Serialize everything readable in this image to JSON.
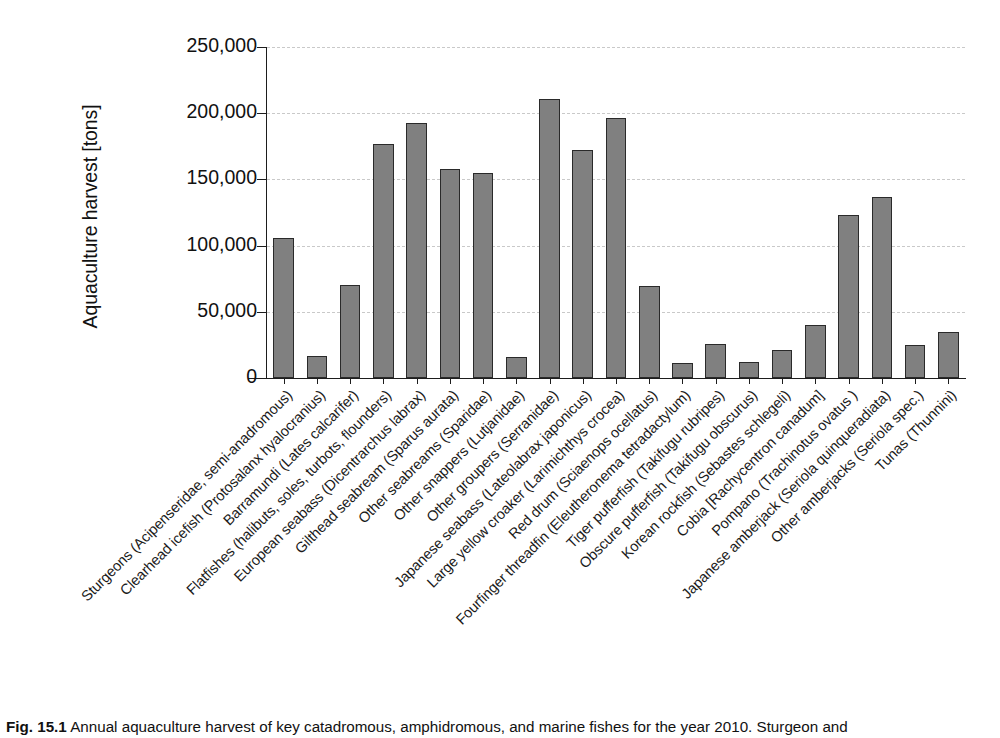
{
  "figure": {
    "caption_number": "Fig. 15.1",
    "caption_text": "Annual aquaculture harvest of key catadromous, amphidromous, and marine fishes for the year 2010. Sturgeon and"
  },
  "chart_data": {
    "type": "bar",
    "title": "",
    "xlabel": "",
    "ylabel": "Aquaculture harvest [tons]",
    "ylim": [
      0,
      250000
    ],
    "ytick_labels": [
      "0",
      "50,000",
      "100,000",
      "150,000",
      "200,000",
      "250,000"
    ],
    "ytick_values": [
      0,
      50000,
      100000,
      150000,
      200000,
      250000
    ],
    "grid": true,
    "legend": "none",
    "bar_color": "#808080",
    "bar_edge_color": "#2a2a2a",
    "grid_color": "#c9c9c9",
    "axis_color": "#1d1d1d",
    "categories": [
      "Sturgeons (Acipenseridae, semi-anadromous)",
      "Clearhead icefish (Protosalanx hyalocranius)",
      "Barramundi (Lates calcarifer)",
      "Flatfishes (halibuts, soles, turbots, flounders)",
      "European seabass (Dicentrarchus labrax)",
      "Gilthead seabream (Sparus aurata)",
      "Other seabreams (Sparidae)",
      "Other snappers (Lutjanidae)",
      "Other groupers (Serranidae)",
      "Japanese seabass (Lateolabrax japonicus)",
      "Large yellow croaker (Larimichthys crocea)",
      "Red drum (Sciaenops ocellatus)",
      "Fourfinger threadfin (Eleutheronema tetradactylum)",
      "Tiger pufferfish (Takifugu rubripes)",
      "Obscure pufferfish (Takifugu obscurus)",
      "Korean rockfish (Sebastes schlegeli)",
      "Cobia [Rachycentron canadum]",
      "Pompano (Trachinotus ovatus )",
      "Japanese amberjack (Seriola quinqueradiata)",
      "Other amberjacks (Seriola spec.)",
      "Tunas (Thunnini)"
    ],
    "values": [
      105700,
      16500,
      70500,
      176500,
      192500,
      157500,
      154500,
      15500,
      211000,
      172500,
      196500,
      69500,
      11000,
      26000,
      12000,
      21000,
      40000,
      123000,
      137000,
      25000,
      35000
    ]
  }
}
